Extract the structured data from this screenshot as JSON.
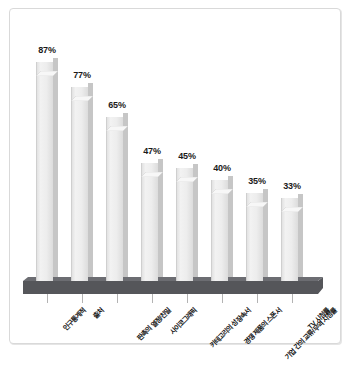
{
  "chart_data": {
    "type": "bar",
    "title": "",
    "subtitle": "",
    "xlabel": "",
    "ylabel": "",
    "ylim": [
      0,
      100
    ],
    "grid": false,
    "legend": "none",
    "value_suffix": "%",
    "categories": [
      "인구통계적",
      "출처",
      "판촉의 열정/친밀",
      "사이코그래픽",
      "카테고리의 성장속서",
      "경쟁 제품의 스폰서",
      "기업 간의 교류/무역 시청률",
      "TV 시청률"
    ],
    "values": [
      87,
      77,
      65,
      47,
      45,
      40,
      35,
      33
    ],
    "value_labels": [
      "87%",
      "77%",
      "65%",
      "47%",
      "45%",
      "40%",
      "35%",
      "33%"
    ]
  },
  "style": {
    "bar_face_color": "#eeeeee",
    "bar_side_color": "#c6c6c6",
    "platform_color": "#55565a",
    "frame_border_color": "#d9d9d9",
    "background_color": "#ffffff",
    "label_color": "#1a1a1a"
  }
}
